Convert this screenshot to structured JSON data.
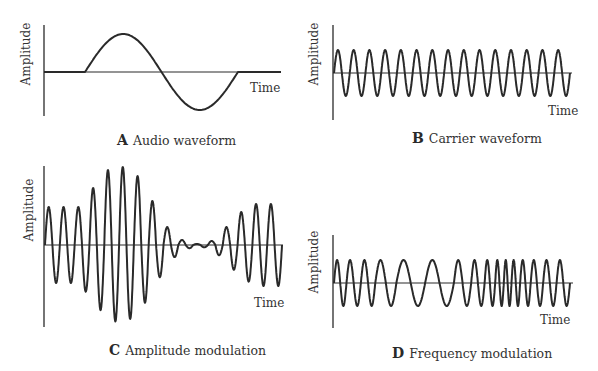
{
  "panels": [
    {
      "id": "A",
      "letter": "A",
      "caption": "Audio waveform",
      "y_label": "Amplitude",
      "x_label": "Time",
      "waveform": "single sine cycle on flat baseline",
      "geom": {
        "axis_x": 44,
        "axis_top": 25,
        "axis_bottom": 116,
        "base_y": 72,
        "base_end": 281,
        "ylab_x": 30,
        "ylab_cy": 54,
        "xlab_x": 250,
        "xlab_y": 92,
        "cap_x": 117,
        "cap_y": 132
      }
    },
    {
      "id": "B",
      "letter": "B",
      "caption": "Carrier waveform",
      "y_label": "Amplitude",
      "x_label": "Time",
      "waveform": "constant-amplitude constant-frequency sine, 15 cycles",
      "geom": {
        "axis_x": 333,
        "axis_top": 25,
        "axis_bottom": 120,
        "base_y": 73,
        "base_end": 572,
        "ylab_x": 318,
        "ylab_cy": 54,
        "xlab_x": 548,
        "xlab_y": 115,
        "cap_x": 412,
        "cap_y": 130
      }
    },
    {
      "id": "C",
      "letter": "C",
      "caption": "Amplitude modulation",
      "y_label": "Amplitude",
      "x_label": "Time",
      "waveform": "carrier with envelope varying by audio signal",
      "geom": {
        "axis_x": 44,
        "axis_top": 166,
        "axis_bottom": 327,
        "base_y": 245,
        "base_end": 283,
        "ylab_x": 33,
        "ylab_cy": 210,
        "xlab_x": 254,
        "xlab_y": 307,
        "cap_x": 109,
        "cap_y": 342
      }
    },
    {
      "id": "D",
      "letter": "D",
      "caption": "Frequency modulation",
      "y_label": "Amplitude",
      "x_label": "Time",
      "waveform": "constant-amplitude sine with varying frequency",
      "geom": {
        "axis_x": 333,
        "axis_top": 235,
        "axis_bottom": 328,
        "base_y": 283,
        "base_end": 573,
        "ylab_x": 318,
        "ylab_cy": 262,
        "xlab_x": 540,
        "xlab_y": 324,
        "cap_x": 392,
        "cap_y": 345
      }
    }
  ],
  "chart_data": [
    {
      "type": "line",
      "title": "A Audio waveform",
      "xlabel": "Time",
      "ylabel": "Amplitude",
      "description": "Flat, then one full sine cycle (positive half then negative half), then flat",
      "segments": [
        {
          "x_start": 44,
          "x_end": 85,
          "kind": "flat"
        },
        {
          "x_start": 85,
          "x_end": 238,
          "kind": "sine",
          "cycles": 1,
          "amplitude_px": 38
        },
        {
          "x_start": 238,
          "x_end": 281,
          "kind": "flat"
        }
      ]
    },
    {
      "type": "line",
      "title": "B Carrier waveform",
      "xlabel": "Time",
      "ylabel": "Amplitude",
      "description": "High-frequency sine of constant amplitude",
      "x_start": 334,
      "x_end": 570,
      "cycles": 15,
      "amplitude_px": 23
    },
    {
      "type": "line",
      "title": "C Amplitude modulation",
      "xlabel": "Time",
      "ylabel": "Amplitude",
      "description": "Carrier whose peak amplitude follows the audio waveform",
      "x_start": 45,
      "x_end": 282,
      "cycles": 16,
      "peak_amplitudes_px": [
        38,
        38,
        38,
        57,
        75,
        78,
        69,
        44,
        18,
        5,
        1,
        4,
        18,
        33,
        41,
        41
      ]
    },
    {
      "type": "line",
      "title": "D Frequency modulation",
      "xlabel": "Time",
      "ylabel": "Amplitude",
      "description": "Constant amplitude; frequency decreases then increases following audio signal",
      "x_start": 334,
      "x_end": 570,
      "amplitude_px": 23,
      "cycle_widths_px": [
        13,
        15,
        15,
        22,
        30,
        30,
        18,
        14,
        11,
        9,
        8,
        9,
        11,
        13,
        14,
        14
      ]
    }
  ]
}
